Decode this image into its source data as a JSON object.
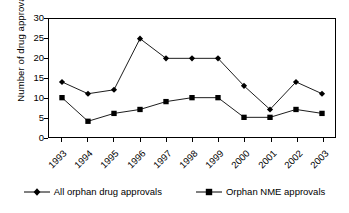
{
  "chart_data": {
    "type": "line",
    "title": "",
    "xlabel": "",
    "ylabel": "Number of drug approvals",
    "categories": [
      "1993",
      "1994",
      "1995",
      "1996",
      "1997",
      "1998",
      "1999",
      "2000",
      "2001",
      "2002",
      "2003"
    ],
    "series": [
      {
        "name": "All orphan drug approvals",
        "marker": "diamond",
        "color": "#000000",
        "values": [
          14,
          11,
          12,
          25,
          20,
          20,
          20,
          13,
          7,
          14,
          11
        ]
      },
      {
        "name": "Orphan NME approvals",
        "marker": "square",
        "color": "#000000",
        "values": [
          10,
          4,
          6,
          7,
          9,
          10,
          10,
          5,
          5,
          7,
          6
        ]
      }
    ],
    "ylim": [
      0,
      30
    ],
    "yticks": [
      0,
      5,
      10,
      15,
      20,
      25,
      30
    ],
    "ytick_labels": [
      "0",
      "5",
      "10",
      "15",
      "20",
      "25",
      "30"
    ],
    "grid": false,
    "legend_position": "bottom",
    "plot_border": true,
    "background": "#ffffff"
  },
  "axis": {
    "y_title": "Number of drug approvals"
  },
  "legend": {
    "entries": [
      {
        "label": "All orphan drug approvals"
      },
      {
        "label": "Orphan NME approvals"
      }
    ]
  }
}
